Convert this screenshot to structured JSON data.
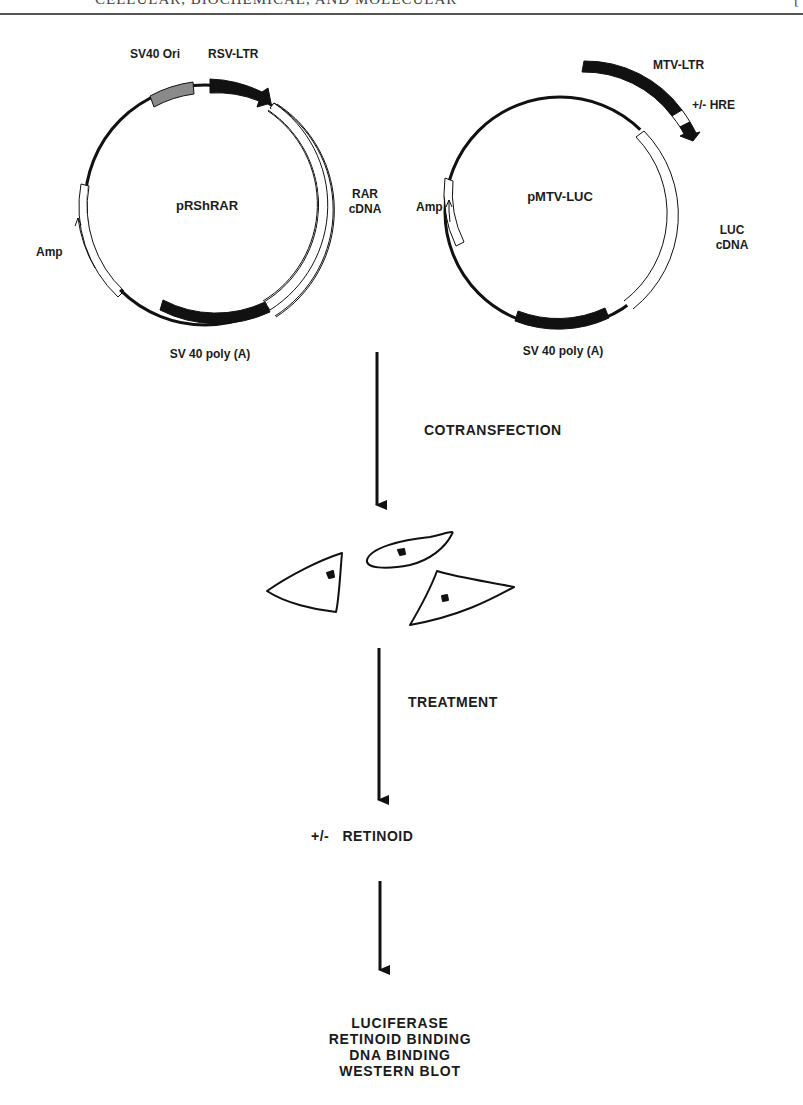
{
  "header": {
    "running_title": "CELLULAR, BIOCHEMICAL, AND MOLECULAR",
    "page_marker": "[",
    "note": "running header cropped at top edge"
  },
  "plasmids": [
    {
      "name": "pRShRAR",
      "elements": [
        {
          "label": "SV40 Ori",
          "style": "gray-box"
        },
        {
          "label": "RSV-LTR",
          "style": "black-arrow"
        },
        {
          "label": "RAR\ncDNA",
          "label_lines": [
            "RAR",
            "cDNA"
          ],
          "style": "open-segment"
        },
        {
          "label": "SV 40 poly (A)",
          "style": "black-box"
        },
        {
          "label": "Amp",
          "style": "open-segment-with-arrow"
        }
      ]
    },
    {
      "name": "pMTV-LUC",
      "elements": [
        {
          "label": "MTV-LTR",
          "style": "black-box"
        },
        {
          "label": "+/- HRE",
          "style": "white-box-with-black-arrow"
        },
        {
          "label": "LUC\ncDNA",
          "label_lines": [
            "LUC",
            "cDNA"
          ],
          "style": "open-segment"
        },
        {
          "label": "SV 40 poly (A)",
          "style": "black-box"
        },
        {
          "label": "Amp",
          "style": "open-segment-with-arrow"
        }
      ]
    }
  ],
  "flow": {
    "steps": [
      {
        "arrow_label": "COTRANSFECTION"
      },
      {
        "stage": "cells",
        "icon": "cell-drawings"
      },
      {
        "arrow_label": "TREATMENT"
      },
      {
        "stage_label": "+/-   RETINOID"
      },
      {
        "arrow_label": ""
      }
    ],
    "results": [
      "LUCIFERASE",
      "RETINOID BINDING",
      "DNA BINDING",
      "WESTERN BLOT"
    ]
  },
  "colors": {
    "ink": "#111111",
    "gray_box": "#8a8a8a",
    "background": "#ffffff"
  }
}
